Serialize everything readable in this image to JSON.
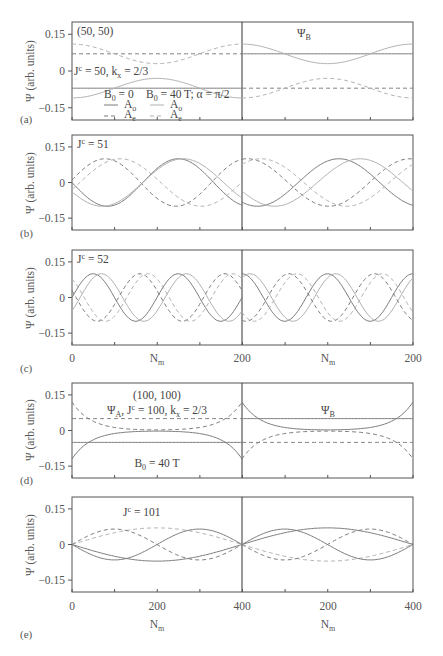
{
  "chart_data": [
    {
      "panel": "(a)",
      "type": "line",
      "ylabel": "Ψ (arb. units)",
      "yticks": [
        "0.15",
        "0",
        "−0.15"
      ],
      "ylim": [
        -0.2,
        0.2
      ],
      "xlim": [
        0,
        200
      ],
      "annotations": [
        "(50, 50)",
        "Jc = 50, kx = 2/3",
        "ΨB"
      ],
      "legend": {
        "col1_title": "B0 = 0",
        "col2_title": "B0 = 40 T; α = π/2",
        "entries": [
          {
            "label": "Ao",
            "style": "solid",
            "group": "B0 = 0"
          },
          {
            "label": "Ae",
            "style": "dashed",
            "group": "B0 = 0"
          },
          {
            "label": "Ao",
            "style": "solid",
            "group": "B0 = 40 T"
          },
          {
            "label": "Ae",
            "style": "dashed",
            "group": "B0 = 40 T"
          }
        ]
      },
      "series_desc": "Left ΨA: B0=0 Ao flat at -0.07, Ae flat at 0.07; B0=40T Ao cosine dip -0.11→-0.03→-0.11, Ae 0.11→0.03→0.11. Right ΨB: B0=0 Ao flat 0.07, Ae flat -0.07; 40T Ao 0.11→0.03→0.11, Ae -0.11→-0.03→-0.11"
    },
    {
      "panel": "(b)",
      "type": "line",
      "annotations": [
        "Jc = 51"
      ],
      "ylim": [
        -0.2,
        0.2
      ],
      "xlim": [
        0,
        200
      ],
      "series_desc": "Sinusoids amplitude ~0.1, roughly one period over each half-panel"
    },
    {
      "panel": "(c)",
      "type": "line",
      "annotations": [
        "Jc = 52"
      ],
      "ylim": [
        -0.2,
        0.2
      ],
      "xlim": [
        0,
        200
      ],
      "xticks": [
        "0",
        "200",
        "200"
      ],
      "xlabel": "Nm",
      "series_desc": "Sinusoids amplitude ~0.1, ~2 periods per half-panel"
    },
    {
      "panel": "(d)",
      "type": "line",
      "ylim": [
        -0.2,
        0.2
      ],
      "xlim": [
        0,
        400
      ],
      "annotations": [
        "(100, 100)",
        "ΨA, Jc = 100, kx = 2/3",
        "ΨB",
        "B0 = 40 T"
      ],
      "series_desc": "Flat lines at ±0.05 (B0=0); edge-localized curves ±0.12 at edges decaying to 0 in bulk"
    },
    {
      "panel": "(e)",
      "type": "line",
      "ylim": [
        -0.2,
        0.2
      ],
      "xlim": [
        0,
        400
      ],
      "annotations": [
        "Jc = 101"
      ],
      "xticks": [
        "0",
        "200",
        "400",
        "200",
        "400"
      ],
      "xlabel": "Nm",
      "series_desc": "Curves vanishing at 0 and 400 with amplitude ~0.07-0.08"
    }
  ],
  "figure": {
    "ylabel": "Ψ (arb. units)",
    "yticks": [
      "0.15",
      "0",
      "−0.15"
    ],
    "panel_labels": [
      "(a)",
      "(b)",
      "(c)",
      "(d)",
      "(e)"
    ],
    "xlabel": "N",
    "xlabel_sub": "m",
    "xticks_c": [
      "0",
      "200",
      "200"
    ],
    "xticks_e": [
      "0",
      "200",
      "400",
      "200",
      "400"
    ],
    "a": {
      "corner": "(50, 50)",
      "jc": "J",
      "jc_sup": "c",
      "jc_rest": " = 50, k",
      "kx_sub": "x",
      "kx_rest": " = 2/3",
      "psib": "Ψ",
      "psib_sub": "B",
      "leg_b0": "B",
      "leg_b0_sub": "0",
      "leg_b0_rest": " = 0",
      "leg_b40_rest": " = 40 T; α = π/2",
      "leg_A": "A",
      "leg_o": "o",
      "leg_e": "e"
    },
    "b": {
      "jc": "J",
      "jc_sup": "c",
      "jc_rest": " = 51"
    },
    "c": {
      "jc": "J",
      "jc_sup": "c",
      "jc_rest": " = 52"
    },
    "d": {
      "corner": "(100, 100)",
      "psia": "Ψ",
      "psia_sub": "A",
      "rest": ", J",
      "jc_sup": "c",
      "rest2": " = 100, k",
      "kx_sub": "x",
      "kx_rest": " = 2/3",
      "psib": "Ψ",
      "psib_sub": "B",
      "b0": "B",
      "b0_sub": "0",
      "b0_rest": " = 40 T"
    },
    "e": {
      "jc": "J",
      "jc_sup": "c",
      "jc_rest": " = 101"
    },
    "colors": {
      "dark": "#7a7a7a",
      "light": "#b0b0b0",
      "frame": "#555555"
    }
  }
}
